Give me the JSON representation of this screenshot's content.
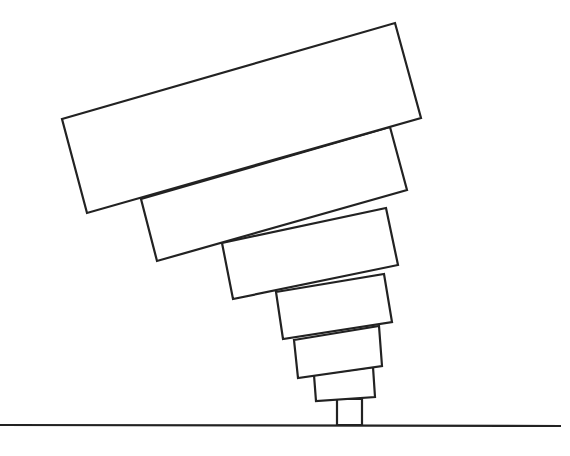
{
  "diagram": {
    "stroke_color": "#222222",
    "background": "#ffffff",
    "ground_line": {
      "x1": 0,
      "y1": 425,
      "x2": 561,
      "y2": 426
    },
    "post": {
      "points": "337,425 337,399 362,399 362,425"
    },
    "blocks": [
      {
        "name": "block-1-largest",
        "points": "62,119 395,23 421,118 87,213"
      },
      {
        "name": "block-2",
        "points": "141,199 390,127 407,190 157,261"
      },
      {
        "name": "block-3",
        "points": "222,243 386,208 398,265 233,299"
      },
      {
        "name": "block-4",
        "points": "276,292 384,274 392,322 283,339"
      },
      {
        "name": "block-5",
        "points": "294,340 379,326 382,366 298,378"
      },
      {
        "name": "block-6-smallest",
        "points": "314,375 373,367 375,397 316,401"
      }
    ]
  }
}
